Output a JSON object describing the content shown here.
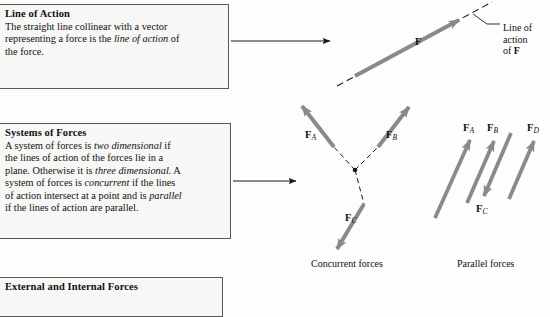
{
  "page": {
    "background_color": "#fdfdfd",
    "ink_color": "#111111",
    "vector_arrow_color": "#808080",
    "box_fill_color": "#f7f7f5",
    "box_border_color": "#5a5a5a"
  },
  "boxes": [
    {
      "id": "line-of-action",
      "title": "Line of Action",
      "lines": [
        {
          "pre": "The straight line collinear with a vector",
          "em": "",
          "post": ""
        },
        {
          "pre": "representing a force is the ",
          "em": "line of action",
          "post": " of"
        },
        {
          "pre": "the force.",
          "em": "",
          "post": ""
        }
      ]
    },
    {
      "id": "systems-of-forces",
      "title": "Systems of Forces",
      "lines": [
        {
          "pre": "A system of forces is ",
          "em": "two dimensional",
          "post": " if"
        },
        {
          "pre": "the lines of action of the forces lie in a",
          "em": "",
          "post": ""
        },
        {
          "pre": "plane. Otherwise it is ",
          "em": "three dimensional.",
          "post": " A"
        },
        {
          "pre": "system of forces is ",
          "em": "concurrent",
          "post": " if the lines"
        },
        {
          "pre": "of action intersect at a point and is ",
          "em": "parallel",
          "post": ""
        },
        {
          "pre": "if the lines of action are parallel.",
          "em": "",
          "post": ""
        }
      ]
    },
    {
      "id": "external-internal",
      "title": "External and Internal Forces",
      "lines": []
    }
  ],
  "connectors": [
    {
      "name": "connector-to-line-of-action-figure",
      "from_x": 231,
      "from_y": 41,
      "to_x": 331,
      "to_y": 41
    },
    {
      "name": "connector-to-systems-of-forces-figure",
      "from_x": 233,
      "from_y": 181,
      "to_x": 297,
      "to_y": 181
    }
  ],
  "figures": [
    {
      "id": "line-of-action-figure",
      "caption": "",
      "labels": [
        {
          "name": "force-label-F",
          "text": "F",
          "sub": "",
          "x": 417,
          "y": 42
        },
        {
          "name": "line-of-action-callout-line-1",
          "text": "Line of",
          "x": 481,
          "y": 28
        },
        {
          "name": "line-of-action-callout-line-2",
          "text": "action",
          "x": 481,
          "y": 40
        },
        {
          "name": "line-of-action-callout-line-3-pre",
          "text": "of ",
          "x": 481,
          "y": 52
        },
        {
          "name": "line-of-action-callout-line-3-bold",
          "text": "F",
          "x": 493,
          "y": 52
        }
      ]
    },
    {
      "id": "concurrent-forces-figure",
      "caption": "Concurrent forces",
      "labels": [
        {
          "name": "force-label-FA",
          "text": "F",
          "sub": "A",
          "x": 305,
          "y": 135
        },
        {
          "name": "force-label-FB",
          "text": "F",
          "sub": "B",
          "x": 386,
          "y": 135
        },
        {
          "name": "force-label-FC",
          "text": "F",
          "sub": "C",
          "x": 345,
          "y": 218
        }
      ]
    },
    {
      "id": "parallel-forces-figure",
      "caption": "Parallel forces",
      "labels": [
        {
          "name": "force-label-FA",
          "text": "F",
          "sub": "A",
          "x": 464,
          "y": 128
        },
        {
          "name": "force-label-FB",
          "text": "F",
          "sub": "B",
          "x": 487,
          "y": 128
        },
        {
          "name": "force-label-FD",
          "text": "F",
          "sub": "D",
          "x": 527,
          "y": 128
        },
        {
          "name": "force-label-FC",
          "text": "F",
          "sub": "C",
          "x": 477,
          "y": 210
        }
      ]
    }
  ],
  "captions": {
    "concurrent": "Concurrent forces",
    "parallel": "Parallel forces"
  }
}
